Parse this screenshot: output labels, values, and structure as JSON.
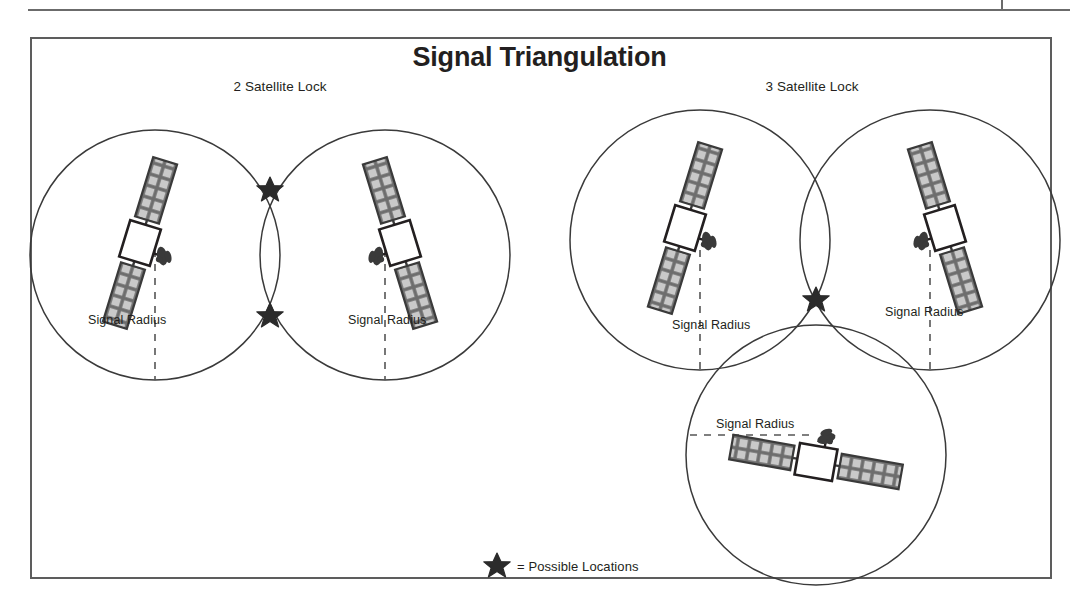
{
  "figure": {
    "title": "Signal Triangulation",
    "groups": [
      {
        "id": "two-satellite",
        "label": "2 Satellite Lock"
      },
      {
        "id": "three-satellite",
        "label": "3 Satellite Lock"
      }
    ],
    "radius_labels": [
      "Signal Radius",
      "Signal Radius",
      "Signal Radius",
      "Signal Radius",
      "Signal Radius"
    ],
    "legend": {
      "marker": "star-icon",
      "text": "= Possible Locations"
    },
    "colors": {
      "ink": "#231f20",
      "circle_stroke": "#3a3a3a",
      "border": "#5d5d5d",
      "panel_fill": "#6d6d6d",
      "panel_cell": "#c9c9c9",
      "body_fill": "#ffffff",
      "star_fill": "#2b2b2b",
      "dash": "#555555",
      "page_rule": "#6b6b6b"
    },
    "geometry": {
      "two_satellite": {
        "circles": [
          {
            "cx": 155,
            "cy": 255,
            "r": 125
          },
          {
            "cx": 385,
            "cy": 255,
            "r": 125
          }
        ],
        "stars": [
          {
            "x": 270,
            "y": 190
          },
          {
            "x": 270,
            "y": 316
          }
        ]
      },
      "three_satellite": {
        "circles": [
          {
            "cx": 700,
            "cy": 240,
            "r": 130
          },
          {
            "cx": 930,
            "cy": 240,
            "r": 130
          },
          {
            "cx": 816,
            "cy": 455,
            "r": 130
          }
        ],
        "stars": [
          {
            "x": 816,
            "y": 300
          }
        ]
      }
    }
  }
}
